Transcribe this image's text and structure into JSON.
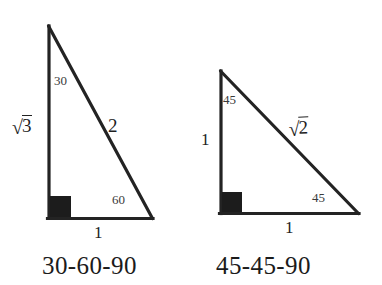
{
  "figure": {
    "background_color": "#ffffff",
    "stroke_color": "#222222"
  },
  "triangles": [
    {
      "id": "triangle-30-60-90",
      "caption": "30-60-90",
      "right_angle_marker": "filled-square",
      "angles": [
        {
          "name": "apex-angle",
          "value": "30"
        },
        {
          "name": "base-right-angle",
          "value": "60"
        }
      ],
      "sides": [
        {
          "name": "vertical-leg",
          "radical": true,
          "radicand": "3",
          "value": "√3"
        },
        {
          "name": "hypotenuse",
          "radical": false,
          "value": "2"
        },
        {
          "name": "horizontal-leg",
          "radical": false,
          "value": "1"
        }
      ],
      "geometry": {
        "apex": [
          48,
          25
        ],
        "bottom_left": [
          48,
          217
        ],
        "bottom_right": [
          152,
          218
        ]
      }
    },
    {
      "id": "triangle-45-45-90",
      "caption": "45-45-90",
      "right_angle_marker": "filled-square",
      "angles": [
        {
          "name": "apex-angle",
          "value": "45"
        },
        {
          "name": "base-right-angle",
          "value": "45"
        }
      ],
      "sides": [
        {
          "name": "vertical-leg",
          "radical": false,
          "value": "1"
        },
        {
          "name": "hypotenuse",
          "radical": true,
          "radicand": "2",
          "value": "√2"
        },
        {
          "name": "horizontal-leg",
          "radical": false,
          "value": "1"
        }
      ],
      "geometry": {
        "apex": [
          220,
          70
        ],
        "bottom_left": [
          220,
          213
        ],
        "bottom_right": [
          358,
          213
        ]
      }
    }
  ],
  "glyphs": {
    "radical_sign": "√"
  }
}
